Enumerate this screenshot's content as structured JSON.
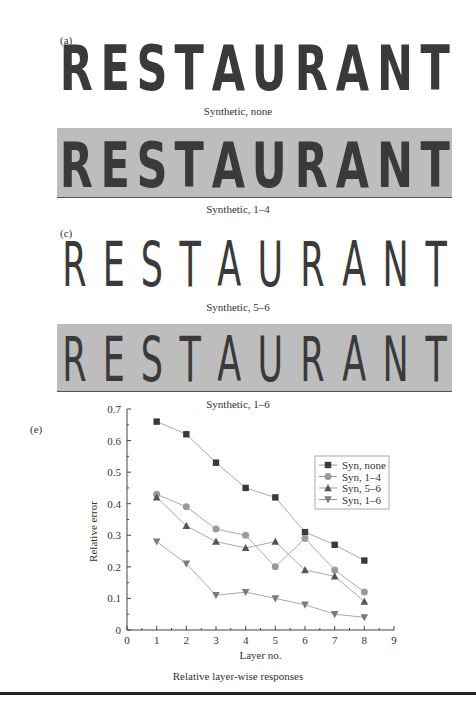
{
  "panels": [
    {
      "label": "(a)",
      "word": "RESTAURANT",
      "caption": "Synthetic, none",
      "style": "bold",
      "shaded": false
    },
    {
      "label": "(b)",
      "word": "RESTAURANT",
      "caption": "Synthetic, 1–4",
      "style": "bold",
      "shaded": true
    },
    {
      "label": "(c)",
      "word": "RESTAURANT",
      "caption": "Synthetic, 5–6",
      "style": "thin",
      "shaded": false
    },
    {
      "label": "(d)",
      "word": "RESTAURANT",
      "caption": "Synthetic, 1–6",
      "style": "thin",
      "shaded": true
    }
  ],
  "chart_panel": {
    "label": "(e)",
    "caption": "Relative layer-wise responses"
  },
  "chart_data": {
    "type": "line",
    "title": "",
    "xlabel": "Layer no.",
    "ylabel": "Relative error",
    "xlim": [
      0,
      9
    ],
    "ylim": [
      0,
      0.7
    ],
    "xticks": [
      "0",
      "1",
      "2",
      "3",
      "4",
      "5",
      "6",
      "7",
      "8",
      "9"
    ],
    "yticks": [
      "0",
      "0.1",
      "0.2",
      "0.3",
      "0.4",
      "0.5",
      "0.6",
      "0.7"
    ],
    "grid": false,
    "legend_position": "upper right",
    "x": [
      1,
      2,
      3,
      4,
      5,
      6,
      7,
      8
    ],
    "series": [
      {
        "name": "Syn, none",
        "marker": "square",
        "color": "#3a3a3a",
        "values": [
          0.66,
          0.62,
          0.53,
          0.45,
          0.42,
          0.31,
          0.27,
          0.22
        ]
      },
      {
        "name": "Syn, 1–4",
        "marker": "circle",
        "color": "#9a9a9a",
        "values": [
          0.43,
          0.39,
          0.32,
          0.3,
          0.2,
          0.29,
          0.19,
          0.12
        ]
      },
      {
        "name": "Syn, 5–6",
        "marker": "triangle-up",
        "color": "#555555",
        "values": [
          0.42,
          0.33,
          0.28,
          0.26,
          0.28,
          0.19,
          0.17,
          0.09
        ]
      },
      {
        "name": "Syn, 1–6",
        "marker": "triangle-down",
        "color": "#7a7a7a",
        "values": [
          0.28,
          0.21,
          0.11,
          0.12,
          0.1,
          0.08,
          0.05,
          0.04
        ]
      }
    ]
  }
}
